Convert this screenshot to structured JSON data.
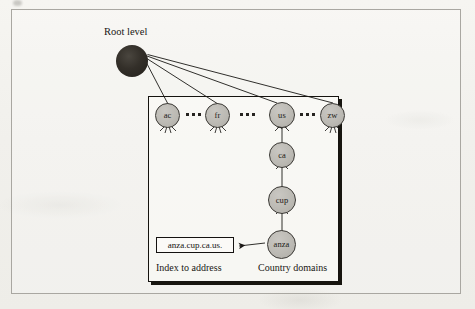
{
  "figure": {
    "type": "dns-hierarchy-diagram",
    "root": {
      "label": "Root level",
      "node_name": "root-node"
    },
    "country_nodes": [
      {
        "label": "ac"
      },
      {
        "label": "fr"
      },
      {
        "label": "us"
      },
      {
        "label": "zw"
      }
    ],
    "ellipses": [
      {
        "text": "•••"
      },
      {
        "text": "•••"
      },
      {
        "text": "•••"
      }
    ],
    "subdomain_chain": [
      {
        "label": "ca"
      },
      {
        "label": "cup"
      },
      {
        "label": "anza"
      }
    ],
    "address_box": {
      "text": "anza.cup.ca.us."
    },
    "captions": {
      "index_to_address": "Index to address",
      "country_domains": "Country domains"
    },
    "colors": {
      "root_fill": "#23201b",
      "node_fill": "#bcbab4",
      "node_stroke": "#3a3834",
      "line": "#1a1815",
      "outer_border": "#a9a7a1",
      "box_border": "#15130f",
      "paper": "#f3f2ee"
    }
  }
}
